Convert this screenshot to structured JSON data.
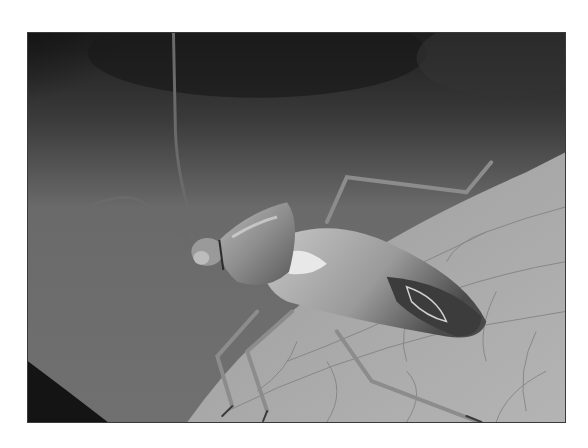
{
  "image": {
    "kind": "photograph",
    "color_mode": "grayscale",
    "subject": "true bug (insect) perched on the edge of a leaf",
    "alt_text": "Grayscale close-up photograph of a long-legged bug with long antennae standing on a veined leaf",
    "frame": {
      "x": 27,
      "y": 32,
      "width": 539,
      "height": 391,
      "border_color": "#3a3a3a"
    },
    "palette": {
      "background_dark": "#1c1c1c",
      "background_mid": "#6e6e6e",
      "leaf_light": "#a9a9a9",
      "leaf_vein": "#7a7a7a",
      "insect_body": "#9a9a9a",
      "insect_highlight": "#d8d8d8",
      "insect_shadow": "#3c3c3c"
    }
  }
}
